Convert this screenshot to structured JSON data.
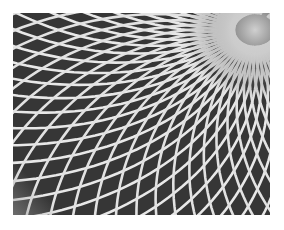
{
  "image": {
    "description": "Black-and-white photograph of a curved white lattice grid over dark background, lines converging toward a vanishing point at upper right",
    "colors": {
      "background": "#ffffff",
      "cells": "#3a3a3a",
      "lattice": "#e6e6e6",
      "glow": "#cfcfcf"
    },
    "frame": {
      "x": 13,
      "y": 13,
      "width": 257,
      "height": 202
    },
    "focal_point": {
      "x": 255,
      "y": 30
    }
  }
}
